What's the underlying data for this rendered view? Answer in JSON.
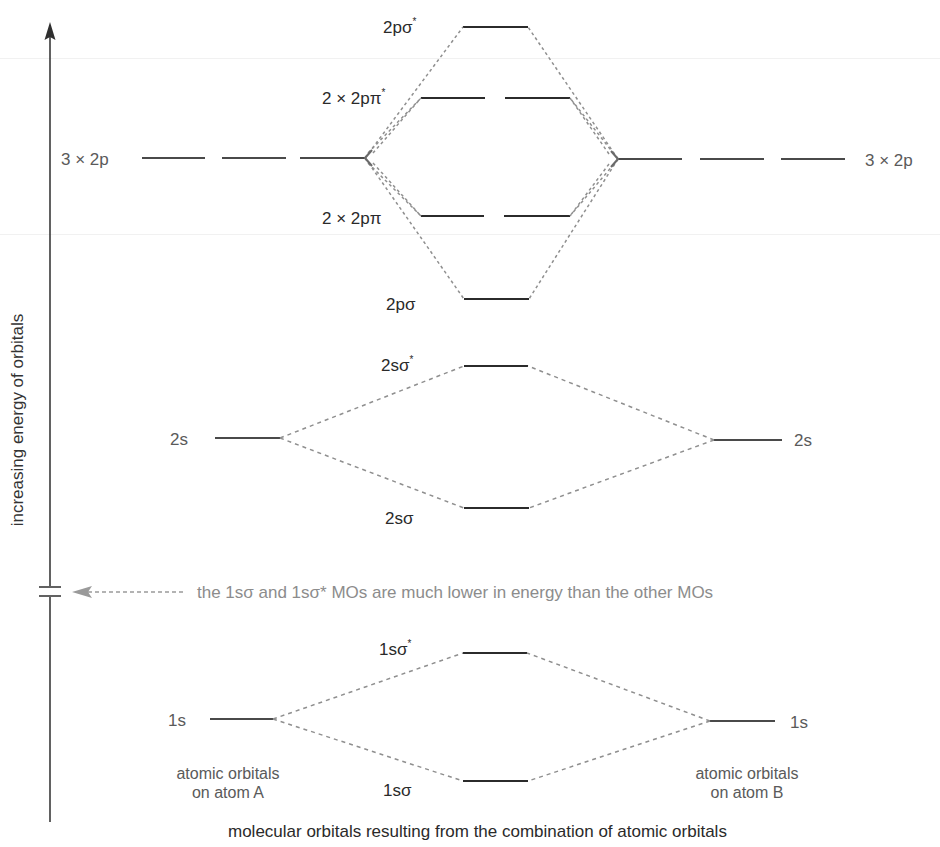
{
  "diagram": {
    "type": "molecular-orbital-energy-diagram",
    "colors": {
      "level_line": "#2b2b2b",
      "ao_line": "#4a4a4a",
      "connector": "#8f8f8f",
      "axis": "#3a3a3a",
      "note_text": "#8c8c8c",
      "mo_label": "#2a2a2a",
      "ao_label": "#5a5a5a"
    },
    "axis": {
      "label": "increasing energy of orbitals",
      "has_break": true
    },
    "atomic_orbitals": {
      "atom_a": {
        "caption_line1": "atomic orbitals",
        "caption_line2": "on atom A",
        "p_label": "3 × 2p",
        "s2_label": "2s",
        "s1_label": "1s"
      },
      "atom_b": {
        "caption_line1": "atomic orbitals",
        "caption_line2": "on atom B",
        "p_label": "3 × 2p",
        "s2_label": "2s",
        "s1_label": "1s"
      }
    },
    "molecular_orbitals": [
      {
        "id": "2psigma_star",
        "base": "2pσ",
        "star": "*",
        "degeneracy": 1
      },
      {
        "id": "2ppi_star",
        "base": "2 × 2pπ",
        "star": "*",
        "degeneracy": 2
      },
      {
        "id": "2ppi",
        "base": "2 × 2pπ",
        "star": "",
        "degeneracy": 2
      },
      {
        "id": "2psigma",
        "base": "2pσ",
        "star": "",
        "degeneracy": 1
      },
      {
        "id": "2ssigma_star",
        "base": "2sσ",
        "star": "*",
        "degeneracy": 1
      },
      {
        "id": "2ssigma",
        "base": "2sσ",
        "star": "",
        "degeneracy": 1
      },
      {
        "id": "1ssigma_star",
        "base": "1sσ",
        "star": "*",
        "degeneracy": 1
      },
      {
        "id": "1ssigma",
        "base": "1sσ",
        "star": "",
        "degeneracy": 1
      }
    ],
    "note": "the 1sσ and 1sσ* MOs are much lower in energy than the other MOs",
    "caption": "molecular orbitals resulting from the combination of atomic orbitals"
  }
}
